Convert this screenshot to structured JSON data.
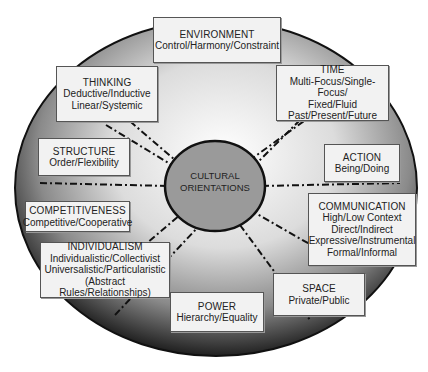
{
  "diagram": {
    "center": {
      "line1": "CULTURAL",
      "line2": "ORIENTATIONS"
    },
    "colors": {
      "box_fill": "#f2f2f2",
      "center_fill": "#9a9a9a",
      "outline": "#111111",
      "gradient_light": "#ffffff",
      "gradient_dark": "#1a1a1a"
    },
    "boxes": [
      {
        "title": "ENVIRONMENT",
        "lines": [
          "Control/Harmony/Constraint"
        ]
      },
      {
        "title": "THINKING",
        "lines": [
          "Deductive/Inductive",
          "Linear/Systemic"
        ]
      },
      {
        "title": "TIME",
        "lines": [
          "Multi-Focus/Single-Focus/",
          "Fixed/Fluid",
          "Past/Present/Future"
        ]
      },
      {
        "title": "STRUCTURE",
        "lines": [
          "Order/Flexibility"
        ]
      },
      {
        "title": "ACTION",
        "lines": [
          "Being/Doing"
        ]
      },
      {
        "title": "COMPETITIVENESS",
        "lines": [
          "Competitive/Cooperative"
        ]
      },
      {
        "title": "COMMUNICATION",
        "lines": [
          "High/Low Context",
          "Direct/Indirect",
          "Expressive/Instrumental",
          "Formal/Informal"
        ]
      },
      {
        "title": "INDIVIDUALISM",
        "lines": [
          "Individualistic/Collectivist",
          "Universalistic/Particularistic",
          "(Abstract Rules/Relationships)"
        ]
      },
      {
        "title": "POWER",
        "lines": [
          "Hierarchy/Equality"
        ]
      },
      {
        "title": "SPACE",
        "lines": [
          "Private/Public"
        ]
      }
    ]
  }
}
